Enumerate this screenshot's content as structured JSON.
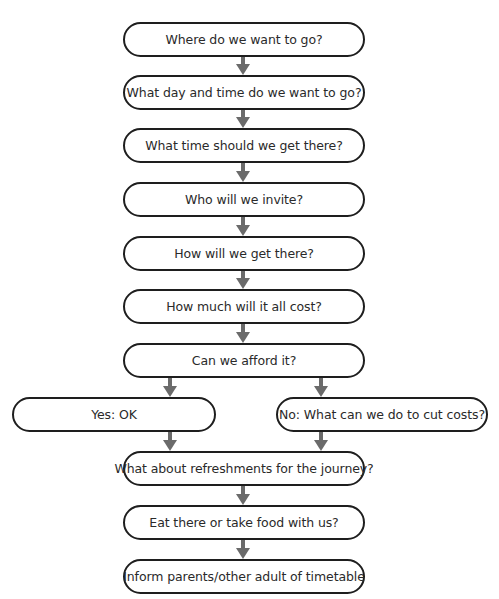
{
  "diagram": {
    "type": "flowchart",
    "colors": {
      "border": "#1e1e1e",
      "arrow": "#6b6b6b",
      "text": "#2a2a2a",
      "background": "#ffffff"
    },
    "nodes": [
      {
        "id": "n1",
        "label": "Where do we want to go?"
      },
      {
        "id": "n2",
        "label": "What day and time do we want to go?"
      },
      {
        "id": "n3",
        "label": "What time should we get there?"
      },
      {
        "id": "n4",
        "label": "Who will we invite?"
      },
      {
        "id": "n5",
        "label": "How will we get there?"
      },
      {
        "id": "n6",
        "label": "How much will it all cost?"
      },
      {
        "id": "n7",
        "label": "Can we afford it?"
      },
      {
        "id": "n8",
        "label": "Yes: OK"
      },
      {
        "id": "n9",
        "label": "No: What can we do to cut costs?"
      },
      {
        "id": "n10",
        "label": "What about refreshments for the journey?"
      },
      {
        "id": "n11",
        "label": "Eat there or take food with us?"
      },
      {
        "id": "n12",
        "label": "Inform parents/other adult of timetable"
      }
    ],
    "edges": [
      {
        "from": "n1",
        "to": "n2"
      },
      {
        "from": "n2",
        "to": "n3"
      },
      {
        "from": "n3",
        "to": "n4"
      },
      {
        "from": "n4",
        "to": "n5"
      },
      {
        "from": "n5",
        "to": "n6"
      },
      {
        "from": "n6",
        "to": "n7"
      },
      {
        "from": "n7",
        "to": "n8"
      },
      {
        "from": "n7",
        "to": "n9"
      },
      {
        "from": "n8",
        "to": "n10"
      },
      {
        "from": "n9",
        "to": "n10"
      },
      {
        "from": "n10",
        "to": "n11"
      },
      {
        "from": "n11",
        "to": "n12"
      }
    ]
  }
}
